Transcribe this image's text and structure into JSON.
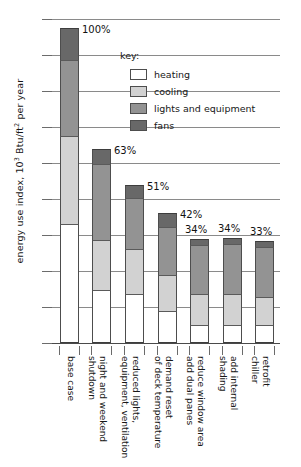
{
  "chart_data": {
    "type": "bar",
    "stacked": true,
    "title": "",
    "xlabel": "",
    "ylabel": "energy use index, 10³ Btu/ft² per year",
    "ylabel_prefix": "energy use index, 10",
    "ylabel_sup1": "3",
    "ylabel_mid": " Btu/ft",
    "ylabel_sup2": "2",
    "ylabel_suffix": " per year",
    "ylim": [
      0,
      450
    ],
    "yticks": [
      0,
      50,
      100,
      150,
      200,
      250,
      300,
      350,
      400,
      450
    ],
    "ytick_labels": [
      "0",
      "50",
      "100",
      "150",
      "200",
      "250",
      "300",
      "350",
      "400",
      "450"
    ],
    "grid": true,
    "legend_position": "inside-upper-right",
    "legend_title": "key:",
    "categories": [
      "base case",
      "night and weekend shutdown",
      "reduced lights, equipment, ventilation",
      "demand reset of deck temperature",
      "reduce window area add dual panes",
      "add internal shading",
      "retrofit chiller"
    ],
    "category_lines": [
      [
        "base case"
      ],
      [
        "night and weekend",
        "shutdown"
      ],
      [
        "reduced lights,",
        "equipment, ventilation"
      ],
      [
        "demand reset",
        "of deck temperature"
      ],
      [
        "reduce window area",
        "add dual panes"
      ],
      [
        "add internal",
        "shading"
      ],
      [
        "retrofit",
        "chiller"
      ]
    ],
    "series": [
      {
        "name": "heating",
        "color": "#ffffff",
        "values": [
          165,
          73,
          68,
          44,
          25,
          25,
          25
        ]
      },
      {
        "name": "cooling",
        "color": "#d2d2d2",
        "values": [
          123,
          70,
          63,
          51,
          43,
          43,
          39
        ]
      },
      {
        "name": "lights and equipment",
        "color": "#939393",
        "values": [
          105,
          105,
          71,
          66,
          68,
          69,
          69
        ]
      },
      {
        "name": "fans",
        "color": "#686868",
        "values": [
          44,
          22,
          18,
          20,
          9,
          9,
          9
        ]
      }
    ],
    "totals": [
      437,
      270,
      220,
      181,
      145,
      146,
      142
    ],
    "annotations": [
      "100%",
      "63%",
      "51%",
      "42%",
      "34%",
      "34%",
      "33%"
    ]
  },
  "legend": {
    "title": "key:",
    "items": [
      {
        "label": "heating",
        "color": "#ffffff"
      },
      {
        "label": "cooling",
        "color": "#d2d2d2"
      },
      {
        "label": "lights and equipment",
        "color": "#939393"
      },
      {
        "label": "fans",
        "color": "#686868"
      }
    ]
  }
}
